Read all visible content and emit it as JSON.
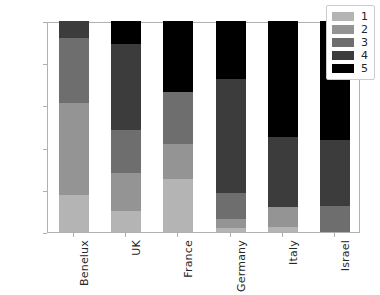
{
  "chart_data": {
    "type": "bar",
    "stacked": true,
    "normalized": true,
    "title": "",
    "xlabel": "",
    "ylabel": "",
    "ylim": [
      0.0,
      1.0
    ],
    "grid": false,
    "legend_position": "upper right (inside axes)",
    "categories": [
      "Benelux",
      "UK",
      "France",
      "Germany",
      "Italy",
      "Israel"
    ],
    "ytick_labels": [
      "0.0",
      "0.2",
      "0.4",
      "0.6",
      "0.8",
      "1.0"
    ],
    "ytick_values": [
      0.0,
      0.2,
      0.4,
      0.6,
      0.8,
      1.0
    ],
    "series": [
      {
        "name": "1",
        "color": "#b4b4b4",
        "values": [
          0.175,
          0.1,
          0.25,
          0.02,
          0.025,
          0.0
        ]
      },
      {
        "name": "2",
        "color": "#949494",
        "values": [
          0.435,
          0.18,
          0.165,
          0.04,
          0.095,
          0.0
        ]
      },
      {
        "name": "3",
        "color": "#6e6e6e",
        "values": [
          0.31,
          0.205,
          0.25,
          0.125,
          0.0,
          0.125
        ]
      },
      {
        "name": "4",
        "color": "#3c3c3c",
        "values": [
          0.08,
          0.405,
          0.0,
          0.54,
          0.33,
          0.31
        ]
      },
      {
        "name": "5",
        "color": "#000000",
        "values": [
          0.0,
          0.11,
          0.335,
          0.275,
          0.55,
          0.565
        ]
      }
    ],
    "cumulative_tops": {
      "Benelux": [
        0.175,
        0.61,
        0.92,
        1.0,
        1.0
      ],
      "UK": [
        0.1,
        0.28,
        0.485,
        0.89,
        1.0
      ],
      "France": [
        0.25,
        0.415,
        0.665,
        0.665,
        1.0
      ],
      "Germany": [
        0.02,
        0.06,
        0.185,
        0.725,
        1.0
      ],
      "Italy": [
        0.025,
        0.12,
        0.12,
        0.45,
        1.0
      ],
      "Israel": [
        0.0,
        0.0,
        0.125,
        0.435,
        1.0
      ]
    }
  },
  "legend": {
    "entries": [
      {
        "label": "1"
      },
      {
        "label": "2"
      },
      {
        "label": "3"
      },
      {
        "label": "4"
      },
      {
        "label": "5"
      }
    ]
  }
}
